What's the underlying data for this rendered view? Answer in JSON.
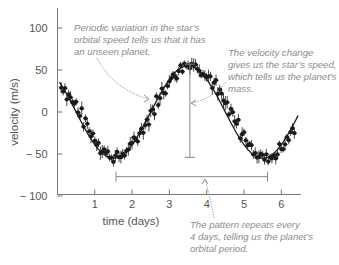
{
  "chart_data": {
    "type": "scatter",
    "title": "",
    "xlabel": "time (days)",
    "ylabel": "velocity (m/s)",
    "xlim": [
      0,
      6.6
    ],
    "ylim": [
      -100,
      120
    ],
    "x_ticks": [
      1,
      2,
      3,
      4,
      5,
      6
    ],
    "x_tick_labels": [
      "1",
      "2",
      "3",
      "4",
      "5",
      "6"
    ],
    "y_ticks": [
      100,
      50,
      0,
      -50,
      -100
    ],
    "y_tick_labels": [
      "100",
      "50",
      "0",
      "− 50",
      "− 100"
    ],
    "grid": false,
    "legend": null,
    "series": [
      {
        "name": "star radial velocity measurements",
        "style": "points with error bars, fitted sinusoid",
        "x": [
          0.15,
          0.3,
          0.45,
          0.6,
          0.75,
          0.9,
          1.05,
          1.2,
          1.35,
          1.5,
          1.65,
          1.8,
          1.95,
          2.1,
          2.25,
          2.4,
          2.55,
          2.7,
          2.85,
          3.0,
          3.15,
          3.3,
          3.45,
          3.6,
          3.75,
          3.9,
          4.05,
          4.2,
          4.35,
          4.5,
          4.65,
          4.8,
          4.95,
          5.1,
          5.25,
          5.4,
          5.55,
          5.7,
          5.85,
          6.0,
          6.15,
          6.3
        ],
        "values": [
          29,
          20,
          10,
          -1,
          -13,
          -25,
          -35,
          -44,
          -50,
          -54,
          -53,
          -49,
          -42,
          -33,
          -22,
          -10,
          2,
          14,
          26,
          36,
          45,
          52,
          56,
          58,
          54,
          49,
          42,
          33,
          22,
          10,
          -2,
          -14,
          -26,
          -36,
          -45,
          -51,
          -55,
          -54,
          -50,
          -43,
          -34,
          -22
        ]
      }
    ],
    "fit": {
      "model": "sinusoid",
      "amplitude": 55,
      "period_days": 4,
      "min_at_days": 1.5,
      "max_at_days": 3.5
    },
    "annotations": [
      {
        "id": "periodic",
        "text_lines": [
          "Periodic variation in the star’s",
          "orbital speed tells us that it has",
          "an unseen planet."
        ]
      },
      {
        "id": "amplitude",
        "text_lines": [
          "The velocity change",
          "gives us the star’s speed,",
          "which tells us the planet’s",
          "mass."
        ],
        "bar": {
          "x": 3.55,
          "from": 57,
          "to": -54
        }
      },
      {
        "id": "period",
        "text_lines": [
          "The pattern repeats every",
          "4 days, telling us the planet’s",
          "orbital period."
        ],
        "bar": {
          "y": -77,
          "from": 1.57,
          "to": 5.63
        }
      }
    ]
  },
  "colors": {
    "axis": "#777777",
    "data": "#1a1a1a",
    "annotation_text": "#8c8c8c",
    "annotation_line": "#888888"
  }
}
